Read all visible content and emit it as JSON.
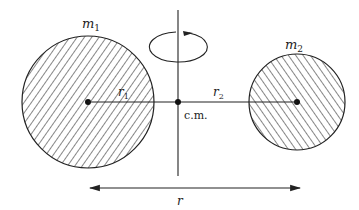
{
  "diagram": {
    "colors": {
      "stroke": "#222222",
      "background": "#ffffff"
    },
    "body1": {
      "label": "m",
      "subscript": "1",
      "radius_label": "r",
      "radius_subscript": "1"
    },
    "body2": {
      "label": "m",
      "subscript": "2",
      "radius_label": "r",
      "radius_subscript": "2"
    },
    "center_of_mass": {
      "label": "c.m."
    },
    "separation": {
      "label": "r"
    },
    "rotation_icon": "rotation-arrow-icon"
  }
}
